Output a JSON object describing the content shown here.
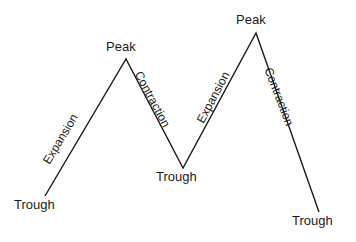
{
  "diagram": {
    "type": "business-cycle-line-diagram",
    "background_color": "#ffffff",
    "stroke_color": "#1a1a1a",
    "text_color": "#1a1a1a",
    "vertices": [
      {
        "name": "trough-1",
        "label": "Trough",
        "x": 45,
        "y": 196,
        "label_x": 14,
        "label_y": 198
      },
      {
        "name": "peak-1",
        "label": "Peak",
        "x": 126,
        "y": 59,
        "label_x": 106,
        "label_y": 40
      },
      {
        "name": "trough-2",
        "label": "Trough",
        "x": 183,
        "y": 168,
        "label_x": 156,
        "label_y": 170
      },
      {
        "name": "peak-2",
        "label": "Peak",
        "x": 256,
        "y": 33,
        "label_x": 236,
        "label_y": 13
      },
      {
        "name": "trough-3",
        "label": "Trough",
        "x": 319,
        "y": 212,
        "label_x": 292,
        "label_y": 214
      }
    ],
    "segments": [
      {
        "name": "expansion-1",
        "label": "Expansion",
        "from": "trough-1",
        "to": "peak-1",
        "label_x": 46,
        "label_y": 157,
        "angle": -59
      },
      {
        "name": "contraction-1",
        "label": "Contraction",
        "from": "peak-1",
        "to": "trough-2",
        "label_x": 138,
        "label_y": 66,
        "angle": 62
      },
      {
        "name": "expansion-2",
        "label": "Expansion",
        "from": "trough-2",
        "to": "peak-2",
        "label_x": 200,
        "label_y": 116,
        "angle": -62
      },
      {
        "name": "contraction-2",
        "label": "Contraction",
        "from": "peak-2",
        "to": "trough-3",
        "label_x": 268,
        "label_y": 62,
        "angle": 69
      }
    ],
    "polyline_points": "45,196 126,59 183,168 256,33 319,212"
  }
}
